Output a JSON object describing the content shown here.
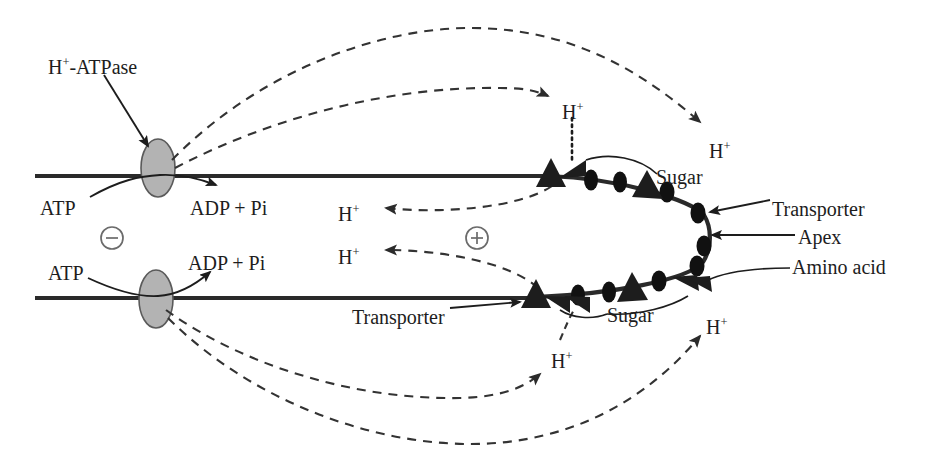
{
  "diagram": {
    "colors": {
      "ink": "#1d1d1d",
      "membrane": "#2a2a2a",
      "pump_fill": "#b3b3b3",
      "pump_stroke": "#555555",
      "dashed": "#3a3a3a",
      "background": "#ffffff"
    }
  },
  "labels": {
    "h_atpase": "H",
    "h_atpase_sup": "+",
    "h_atpase_rest": "-ATPase",
    "atp_top": "ATP",
    "adp_top": "ADP + Pi",
    "atp_bottom": "ATP",
    "adp_bottom": "ADP + Pi",
    "minus_sign": "−",
    "plus_sign": "+",
    "sugar_top": "Sugar",
    "sugar_bottom": "Sugar",
    "transporter_right": "Transporter",
    "transporter_bottom": "Transporter",
    "apex": "Apex",
    "amino_acid": "Amino acid",
    "h_plus_base": "H",
    "h_plus_sup": "+"
  },
  "proton_labels": [
    {
      "id": "h-plus-inner-top",
      "text": "H",
      "sup": "+",
      "x": 562,
      "y": 101
    },
    {
      "id": "h-plus-outer-top",
      "text": "H",
      "sup": "+",
      "x": 709,
      "y": 140
    },
    {
      "id": "h-plus-left-upper",
      "text": "H",
      "sup": "+",
      "x": 338,
      "y": 203
    },
    {
      "id": "h-plus-left-lower",
      "text": "H",
      "sup": "+",
      "x": 338,
      "y": 246
    },
    {
      "id": "h-plus-inner-bottom",
      "text": "H",
      "sup": "+",
      "x": 551,
      "y": 350
    },
    {
      "id": "h-plus-outer-bottom",
      "text": "H",
      "sup": "+",
      "x": 706,
      "y": 316
    }
  ],
  "membranes": [
    {
      "id": "upper-membrane",
      "y": 176,
      "x_start": 35,
      "x_end": 553
    },
    {
      "id": "lower-membrane",
      "y": 298,
      "x_start": 35,
      "x_end": 538
    }
  ],
  "pumps": [
    {
      "id": "h-atpase-pump-upper",
      "cx": 158,
      "cy": 168,
      "rx": 17,
      "ry": 29
    },
    {
      "id": "h-atpase-pump-lower",
      "cx": 156,
      "cy": 299,
      "rx": 17,
      "ry": 29
    }
  ],
  "charge_symbols": [
    {
      "id": "negative-charge",
      "sign": "−",
      "cx": 112,
      "cy": 238,
      "r": 11
    },
    {
      "id": "positive-charge",
      "sign": "+",
      "cx": 477,
      "cy": 238,
      "r": 11
    }
  ],
  "apex_curve": {
    "id": "apex-membrane-curve",
    "description": "Rounded apex of the root hair joining upper and lower membranes",
    "top_join_x": 550,
    "bottom_join_x": 536,
    "apex_x": 706
  },
  "transporter_triangles": [
    {
      "id": "transporter-top-left",
      "x": 551,
      "y": 176,
      "rot": 0
    },
    {
      "id": "transporter-top-mid",
      "x": 645,
      "y": 186,
      "rot": 12
    },
    {
      "id": "transporter-bottom-left",
      "x": 536,
      "y": 297,
      "rot": 0
    },
    {
      "id": "transporter-bottom-mid",
      "x": 632,
      "y": 288,
      "rot": -12
    },
    {
      "id": "proton-entry-top",
      "x": 572,
      "y": 175,
      "rot": 0
    },
    {
      "id": "proton-entry-bottom-a",
      "x": 557,
      "y": 300,
      "rot": 0
    },
    {
      "id": "proton-entry-bottom-b",
      "x": 576,
      "y": 299,
      "rot": 0
    }
  ],
  "carrier_dots": [
    {
      "id": "carrier-dot-t1",
      "cx": 591,
      "cy": 180
    },
    {
      "id": "carrier-dot-t2",
      "cx": 620,
      "cy": 182
    },
    {
      "id": "carrier-dot-t3",
      "cx": 667,
      "cy": 192
    },
    {
      "id": "carrier-dot-t4",
      "cx": 697,
      "cy": 213
    },
    {
      "id": "carrier-dot-t5",
      "cx": 703,
      "cy": 245
    },
    {
      "id": "carrier-dot-b1",
      "cx": 578,
      "cy": 295
    },
    {
      "id": "carrier-dot-b2",
      "cx": 609,
      "cy": 292
    },
    {
      "id": "carrier-dot-b3",
      "cx": 659,
      "cy": 281
    },
    {
      "id": "carrier-dot-b4",
      "cx": 697,
      "cy": 266
    }
  ],
  "pointer_labels": [
    {
      "id": "label-h-atpase",
      "text": "H⁺-ATPase",
      "x": 48,
      "y": 58
    },
    {
      "id": "label-atp-top",
      "text": "ATP",
      "x": 40,
      "y": 200
    },
    {
      "id": "label-adp-top",
      "text": "ADP + Pi",
      "x": 190,
      "y": 200
    },
    {
      "id": "label-atp-bottom",
      "text": "ATP",
      "x": 48,
      "y": 265
    },
    {
      "id": "label-adp-bottom",
      "text": "ADP + Pi",
      "x": 188,
      "y": 258
    },
    {
      "id": "label-sugar-top",
      "text": "Sugar",
      "x": 660,
      "y": 170
    },
    {
      "id": "label-transporter-right",
      "text": "Transporter",
      "x": 775,
      "y": 203
    },
    {
      "id": "label-apex",
      "text": "Apex",
      "x": 800,
      "y": 232
    },
    {
      "id": "label-amino-acid",
      "text": "Amino acid",
      "x": 795,
      "y": 263
    },
    {
      "id": "label-transporter-bottom",
      "text": "Transporter",
      "x": 355,
      "y": 310
    },
    {
      "id": "label-sugar-bottom",
      "text": "Sugar",
      "x": 610,
      "y": 310
    }
  ]
}
